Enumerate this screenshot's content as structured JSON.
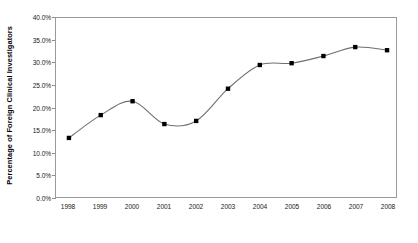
{
  "chart_data": {
    "type": "line",
    "title": "",
    "subtitle": "",
    "xlabel": "",
    "ylabel": "Percentage of Foreign Clinical Investigators",
    "categories": [
      "1998",
      "1999",
      "2000",
      "2001",
      "2002",
      "2003",
      "2004",
      "2005",
      "2006",
      "2007",
      "2008"
    ],
    "values": [
      13.2,
      18.3,
      21.4,
      16.3,
      17.0,
      24.2,
      29.5,
      29.9,
      31.5,
      33.5,
      32.8
    ],
    "series": [
      {
        "name": "Percentage of Foreign Clinical Investigators",
        "values": [
          13.2,
          18.3,
          21.4,
          16.3,
          17.0,
          24.2,
          29.5,
          29.9,
          31.5,
          33.5,
          32.8
        ]
      }
    ],
    "ylim": [
      0,
      40
    ],
    "ytick_values": [
      0,
      5,
      10,
      15,
      20,
      25,
      30,
      35,
      40
    ],
    "ytick_labels": [
      "0.0%",
      "5.0%",
      "10.0%",
      "15.0%",
      "20.0%",
      "25.0%",
      "30.0%",
      "35.0%",
      "40.0%"
    ],
    "grid": false,
    "legend": "none",
    "marker": "square",
    "marker_color": "#000000",
    "line_color": "#6f6f6f",
    "plot_border_color": "#9a9a9a",
    "background_color": "#ffffff",
    "smoothing": "spline"
  }
}
